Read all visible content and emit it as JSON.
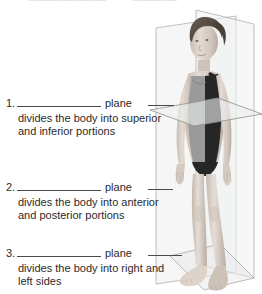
{
  "page": {
    "title_fragment": "anatomical planes worksheet",
    "background_color": "#ffffff",
    "text_color": "#2b2b2b",
    "rule_color": "#4a4a4a"
  },
  "top_cutoff_text": "Name ______________  Date ________",
  "questions": [
    {
      "number": "1.",
      "blank": "",
      "plane_word": "plane",
      "description_line1": "divides the body into superior",
      "description_line2": "and inferior portions"
    },
    {
      "number": "2.",
      "blank": "",
      "plane_word": "plane",
      "description_line1": "divides the body into anterior",
      "description_line2": "and posterior portions"
    },
    {
      "number": "3.",
      "blank": "",
      "plane_word": "plane",
      "description_line1": "divides the body into right and",
      "description_line2": "left sides"
    }
  ],
  "illustration": {
    "subject": "standing-female-figure-in-swimsuit",
    "planes": [
      {
        "name": "transverse-plane",
        "orientation": "horizontal",
        "color": "#eef0f1"
      },
      {
        "name": "frontal-coronal-plane",
        "orientation": "vertical-frontal",
        "color": "#eef0f1"
      },
      {
        "name": "sagittal-plane",
        "orientation": "vertical-sagittal",
        "color": "#eef0f1"
      }
    ],
    "plane_outline_color": "#9a9a9a",
    "skin_color": "#d9cfc6",
    "swimsuit_dark_color": "#2a2a2a",
    "swimsuit_light_color": "#8e8e8e",
    "hair_color": "#5e5148"
  }
}
